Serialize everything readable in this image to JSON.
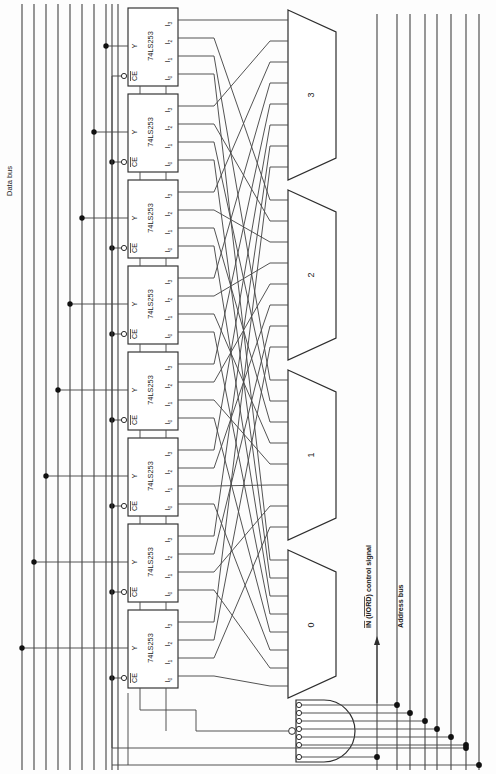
{
  "diagram": {
    "orientation": "rotated-90",
    "background_color": "#fdfdfd",
    "line_color": "#3a3a3a",
    "text_color": "#1a1a1a"
  },
  "buses": {
    "data_bus": {
      "label": "Data bus",
      "line_count": 10,
      "side": "left"
    },
    "address_bus": {
      "label": "Address bus",
      "line_count": 8,
      "side": "right"
    }
  },
  "control": {
    "signal_label": "IN (I/ORD) control signal",
    "signal_label_parts": {
      "in": "IN",
      "paren_open": " (",
      "iord": "I/ORD",
      "paren_close": ") control signal"
    },
    "overbar_on": [
      "IN",
      "I/ORD"
    ]
  },
  "chips": {
    "part_number": "74LS253",
    "count": 8,
    "pins": {
      "output": "Y",
      "enable": "CE",
      "enable_overbar": true,
      "inputs": [
        "I",
        "I",
        "I",
        "I"
      ],
      "input_subscripts": [
        "0",
        "1",
        "2",
        "3"
      ]
    },
    "items": [
      {
        "id": 0,
        "label": "74LS253"
      },
      {
        "id": 1,
        "label": "74LS253"
      },
      {
        "id": 2,
        "label": "74LS253"
      },
      {
        "id": 3,
        "label": "74LS253"
      },
      {
        "id": 4,
        "label": "74LS253"
      },
      {
        "id": 5,
        "label": "74LS253"
      },
      {
        "id": 6,
        "label": "74LS253"
      },
      {
        "id": 7,
        "label": "74LS253"
      }
    ]
  },
  "multiplexers": {
    "count": 4,
    "input_stubs_each": 8,
    "items": [
      {
        "label": "3"
      },
      {
        "label": "2"
      },
      {
        "label": "1"
      },
      {
        "label": "0"
      }
    ]
  },
  "nand_gate": {
    "name": "address-decoder-nand",
    "input_count": 7,
    "inputs_inverted": true,
    "output_inverted": true
  }
}
